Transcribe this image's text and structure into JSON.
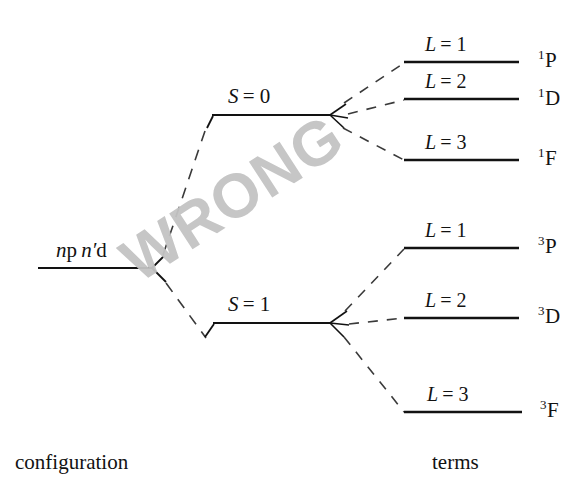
{
  "figure": {
    "watermark": "WRONG",
    "watermark_color": "#c3c3c3",
    "line_color": "#121212",
    "background_color": "#ffffff"
  },
  "captions": {
    "left": "configuration",
    "right": "terms"
  },
  "configuration": {
    "label_parts": {
      "n1": "n",
      "orb1": "p",
      "n2": "n",
      "prime": "′",
      "orb2": "d"
    },
    "label_plain": "np n′d"
  },
  "spin_levels": [
    {
      "id": "S0",
      "label_parts": {
        "symbol": "S",
        "eq": "= 0"
      },
      "label_plain": "S = 0",
      "multiplicity": 1
    },
    {
      "id": "S1",
      "label_parts": {
        "symbol": "S",
        "eq": "= 1"
      },
      "label_plain": "S = 1",
      "multiplicity": 3
    }
  ],
  "terms": [
    {
      "group": "S0",
      "l_label_parts": {
        "symbol": "L",
        "eq": "= 1"
      },
      "l_label_plain": "L = 1",
      "L": 1,
      "term_sup": "1",
      "term_letter": "P",
      "term_plain": "1P"
    },
    {
      "group": "S0",
      "l_label_parts": {
        "symbol": "L",
        "eq": "= 2"
      },
      "l_label_plain": "L = 2",
      "L": 2,
      "term_sup": "1",
      "term_letter": "D",
      "term_plain": "1D"
    },
    {
      "group": "S0",
      "l_label_parts": {
        "symbol": "L",
        "eq": "= 3"
      },
      "l_label_plain": "L = 3",
      "L": 3,
      "term_sup": "1",
      "term_letter": "F",
      "term_plain": "1F"
    },
    {
      "group": "S1",
      "l_label_parts": {
        "symbol": "L",
        "eq": "= 1"
      },
      "l_label_plain": "L = 1",
      "L": 1,
      "term_sup": "3",
      "term_letter": "P",
      "term_plain": "3P"
    },
    {
      "group": "S1",
      "l_label_parts": {
        "symbol": "L",
        "eq": "= 2"
      },
      "l_label_plain": "L = 2",
      "L": 2,
      "term_sup": "3",
      "term_letter": "D",
      "term_plain": "3D"
    },
    {
      "group": "S1",
      "l_label_parts": {
        "symbol": "L",
        "eq": "= 3"
      },
      "l_label_plain": "L = 3",
      "L": 3,
      "term_sup": "3",
      "term_letter": "F",
      "term_plain": "3F"
    }
  ]
}
